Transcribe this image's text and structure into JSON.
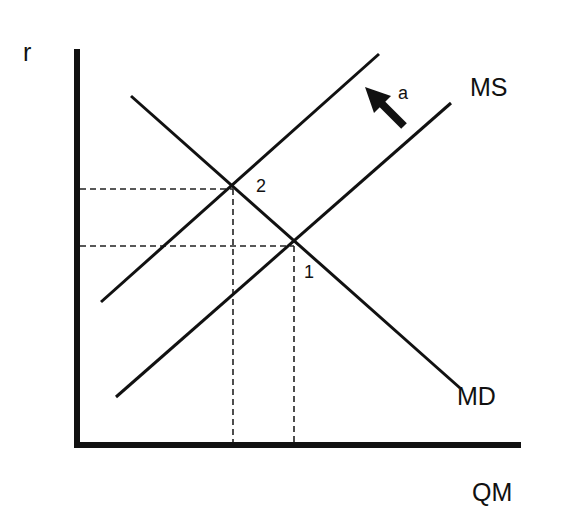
{
  "diagram": {
    "type": "money market supply and demand",
    "axes": {
      "y_label": "r",
      "x_label": "QM"
    },
    "curves": [
      {
        "name": "MS",
        "label": "MS",
        "kind": "supply",
        "from": [
          116,
          397
        ],
        "to": [
          451,
          103
        ]
      },
      {
        "name": "MS_shifted",
        "label": "",
        "kind": "supply (shifted left)",
        "from": [
          101,
          302
        ],
        "to": [
          379,
          54
        ]
      },
      {
        "name": "MD",
        "label": "MD",
        "kind": "demand",
        "from": [
          131,
          96
        ],
        "to": [
          460,
          388
        ]
      }
    ],
    "points": [
      {
        "label": "1",
        "x": 294,
        "y": 246
      },
      {
        "label": "2",
        "x": 233,
        "y": 189
      }
    ],
    "shift_arrow": {
      "label": "a",
      "direction": "up-left"
    },
    "colors": {
      "line": "#111111",
      "background": "#ffffff"
    }
  }
}
